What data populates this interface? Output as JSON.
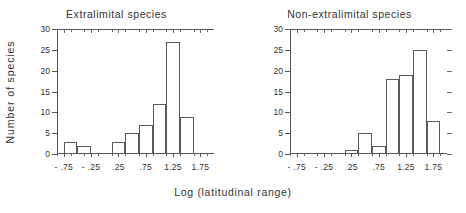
{
  "figure": {
    "xlabel": "Log  (latitudinal  range)",
    "ylabel": "Number  of  species"
  },
  "chart_data": [
    {
      "type": "bar",
      "title": "Extralimital   species",
      "xlabel": "Log  (latitudinal  range)",
      "ylabel": "Number of species",
      "xlim": [
        -0.875,
        2.0
      ],
      "ylim": [
        0,
        30
      ],
      "yticks": [
        0,
        5,
        10,
        15,
        20,
        25,
        30
      ],
      "xticks": [
        -0.75,
        -0.25,
        0.25,
        0.75,
        1.25,
        1.75
      ],
      "xtick_labels": [
        "- .75",
        "- .25",
        ".25",
        ".75",
        "1.25",
        "1.75"
      ],
      "grid": false,
      "legend": "none",
      "bin_width": 0.25,
      "bins": [
        {
          "x0": -0.75,
          "x1": -0.5,
          "value": 3
        },
        {
          "x0": -0.5,
          "x1": -0.25,
          "value": 2
        },
        {
          "x0": 0.125,
          "x1": 0.375,
          "value": 3
        },
        {
          "x0": 0.375,
          "x1": 0.625,
          "value": 5
        },
        {
          "x0": 0.625,
          "x1": 0.875,
          "value": 7
        },
        {
          "x0": 0.875,
          "x1": 1.125,
          "value": 12
        },
        {
          "x0": 1.125,
          "x1": 1.375,
          "value": 27
        },
        {
          "x0": 1.375,
          "x1": 1.625,
          "value": 9
        }
      ],
      "categories": [
        "-0.625",
        "-0.375",
        "0.25",
        "0.5",
        "0.75",
        "1.0",
        "1.25",
        "1.5"
      ],
      "values": [
        3,
        2,
        3,
        5,
        7,
        12,
        27,
        9
      ]
    },
    {
      "type": "bar",
      "title": "Non-extralimital   species",
      "xlabel": "Log  (latitudinal  range)",
      "ylabel": "Number of species",
      "xlim": [
        -0.875,
        2.0
      ],
      "ylim": [
        0,
        30
      ],
      "yticks": [
        0,
        5,
        10,
        15,
        20,
        25,
        30
      ],
      "xticks": [
        -0.75,
        -0.25,
        0.25,
        0.75,
        1.25,
        1.75
      ],
      "xtick_labels": [
        "- .75",
        "- .25",
        ".25",
        ".75",
        "1.25",
        "1.75"
      ],
      "grid": false,
      "legend": "none",
      "bin_width": 0.25,
      "bins": [
        {
          "x0": 0.125,
          "x1": 0.375,
          "value": 1
        },
        {
          "x0": 0.375,
          "x1": 0.625,
          "value": 5
        },
        {
          "x0": 0.625,
          "x1": 0.875,
          "value": 2
        },
        {
          "x0": 0.875,
          "x1": 1.125,
          "value": 18
        },
        {
          "x0": 1.125,
          "x1": 1.375,
          "value": 19
        },
        {
          "x0": 1.375,
          "x1": 1.625,
          "value": 25
        },
        {
          "x0": 1.625,
          "x1": 1.875,
          "value": 8
        }
      ],
      "categories": [
        "0.25",
        "0.5",
        "0.75",
        "1.0",
        "1.25",
        "1.5",
        "1.75"
      ],
      "values": [
        1,
        5,
        2,
        18,
        19,
        25,
        8
      ]
    }
  ]
}
